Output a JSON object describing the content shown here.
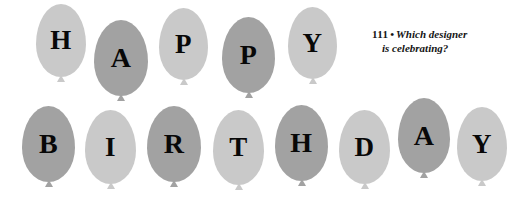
{
  "canvas": {
    "width": 521,
    "height": 197,
    "background": "#ffffff"
  },
  "palette": {
    "balloon_light": "#c9c9c9",
    "balloon_dark": "#a2a2a2",
    "letter_color": "#080808",
    "text_color": "#141414"
  },
  "caption": {
    "number": "111",
    "separator": "•",
    "line1": "Which designer",
    "line2": "is celebrating?",
    "full_text": "111 • Which designer is celebrating?"
  },
  "words": {
    "row1": "HAPPY",
    "row2": "BIRTHDAY"
  },
  "balloons": [
    {
      "letter": "H",
      "shade": "light",
      "row": 1,
      "x": 36,
      "y": 4,
      "w": 50,
      "h": 73,
      "font_size": 27
    },
    {
      "letter": "A",
      "shade": "dark",
      "row": 1,
      "x": 94,
      "y": 20,
      "w": 54,
      "h": 76,
      "font_size": 28
    },
    {
      "letter": "P",
      "shade": "light",
      "row": 1,
      "x": 159,
      "y": 8,
      "w": 49,
      "h": 72,
      "font_size": 27
    },
    {
      "letter": "P",
      "shade": "dark",
      "row": 1,
      "x": 222,
      "y": 17,
      "w": 53,
      "h": 76,
      "font_size": 28
    },
    {
      "letter": "Y",
      "shade": "light",
      "row": 1,
      "x": 288,
      "y": 7,
      "w": 49,
      "h": 72,
      "font_size": 27
    },
    {
      "letter": "B",
      "shade": "dark",
      "row": 2,
      "x": 22,
      "y": 106,
      "w": 53,
      "h": 76,
      "font_size": 28
    },
    {
      "letter": "I",
      "shade": "light",
      "row": 2,
      "x": 85,
      "y": 110,
      "w": 51,
      "h": 74,
      "font_size": 27
    },
    {
      "letter": "R",
      "shade": "dark",
      "row": 2,
      "x": 147,
      "y": 106,
      "w": 54,
      "h": 76,
      "font_size": 28
    },
    {
      "letter": "T",
      "shade": "light",
      "row": 2,
      "x": 213,
      "y": 110,
      "w": 51,
      "h": 75,
      "font_size": 27
    },
    {
      "letter": "H",
      "shade": "dark",
      "row": 2,
      "x": 275,
      "y": 105,
      "w": 53,
      "h": 76,
      "font_size": 28
    },
    {
      "letter": "D",
      "shade": "light",
      "row": 2,
      "x": 339,
      "y": 110,
      "w": 51,
      "h": 74,
      "font_size": 27
    },
    {
      "letter": "A",
      "shade": "dark",
      "row": 2,
      "x": 398,
      "y": 98,
      "w": 52,
      "h": 75,
      "font_size": 28
    },
    {
      "letter": "Y",
      "shade": "light",
      "row": 2,
      "x": 457,
      "y": 107,
      "w": 50,
      "h": 74,
      "font_size": 27
    }
  ]
}
